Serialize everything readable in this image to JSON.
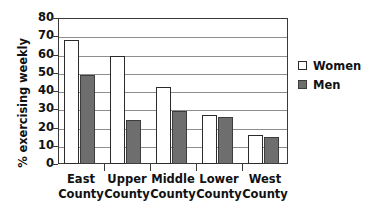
{
  "chart_data": {
    "type": "bar",
    "title": "",
    "subtitle": "",
    "xlabel": "",
    "ylabel": "% exercising weekly",
    "ylim": [
      0,
      80
    ],
    "ytick_step": 10,
    "yticks": [
      80,
      70,
      60,
      50,
      40,
      30,
      20,
      10,
      0
    ],
    "grid": true,
    "grid_axis": "y",
    "legend_position": "right",
    "categories": [
      "East County",
      "Upper County",
      "Middle County",
      "Lower County",
      "West County"
    ],
    "category_lines": [
      [
        "East",
        "County"
      ],
      [
        "Upper",
        "County"
      ],
      [
        "Middle",
        "County"
      ],
      [
        "Lower",
        "County"
      ],
      [
        "West",
        "County"
      ]
    ],
    "series": [
      {
        "name": "Women",
        "color": "#ffffff",
        "edge_color": "#2b2b2b",
        "values": [
          68,
          59,
          42,
          27,
          16
        ]
      },
      {
        "name": "Men",
        "color": "#6e6e6e",
        "edge_color": "#3d3d3d",
        "values": [
          49,
          24,
          29,
          26,
          15
        ]
      }
    ]
  },
  "legend": {
    "entries": [
      {
        "label": "Women"
      },
      {
        "label": "Men"
      }
    ]
  },
  "colors": {
    "women_fill": "#ffffff",
    "men_fill": "#6e6e6e",
    "axis": "#3a3a3a",
    "gridline": "#8e8e8e",
    "text": "#111111",
    "background": "#ffffff"
  }
}
